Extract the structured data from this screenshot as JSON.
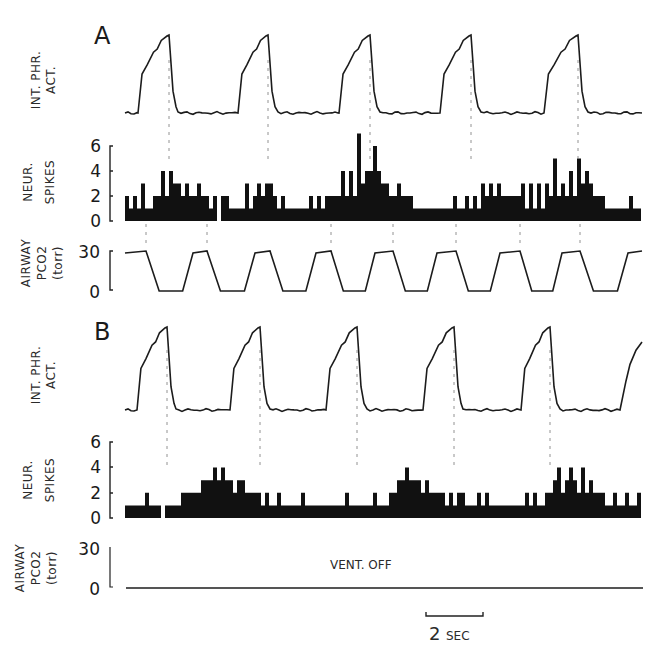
{
  "figure": {
    "panels": [
      {
        "id": "A",
        "label": "A",
        "phrenic": {
          "ylabel_line1": "INT. PHR.",
          "ylabel_line2": "ACT."
        },
        "spikes": {
          "ylabel_line1": "NEUR.",
          "ylabel_line2": "SPIKES",
          "ticks": [
            "6",
            "4",
            "2",
            "0"
          ]
        },
        "pco2": {
          "ylabel_line1": "AIRWAY",
          "ylabel_line2": "PCO2",
          "ylabel_line3": "(torr)",
          "ticks": [
            "30",
            "0"
          ],
          "annotation": ""
        }
      },
      {
        "id": "B",
        "label": "B",
        "phrenic": {
          "ylabel_line1": "INT. PHR.",
          "ylabel_line2": "ACT."
        },
        "spikes": {
          "ylabel_line1": "NEUR.",
          "ylabel_line2": "SPIKES",
          "ticks": [
            "6",
            "4",
            "2",
            "0"
          ]
        },
        "pco2": {
          "ylabel_line1": "AIRWAY",
          "ylabel_line2": "PCO2",
          "ylabel_line3": "(torr)",
          "ticks": [
            "30",
            "0"
          ],
          "annotation": "VENT. OFF"
        }
      }
    ],
    "scale_bar": {
      "value": "2",
      "unit": "SEC"
    }
  },
  "chart_data": [
    {
      "type": "line",
      "panel": "A",
      "title": "Integrated phrenic activity (ventilator on)",
      "ylabel": "INT. PHR. ACT.",
      "xlabel": "time",
      "cycles": 5,
      "cycle_period_sec": 3.5,
      "peak_times_px": [
        169,
        268,
        370,
        471,
        578
      ],
      "rise_start_px": [
        138,
        238,
        339,
        440,
        544
      ],
      "fall_end_px": [
        178,
        278,
        380,
        481,
        588
      ],
      "units": "arbitrary (normalized 0-1)",
      "peak_value": 1.0,
      "baseline_value": 0.0
    },
    {
      "type": "bar",
      "panel": "A",
      "title": "Neuron spike histogram (ventilator on)",
      "ylabel": "NEUR. SPIKES",
      "ylim": [
        0,
        6
      ],
      "yticks": [
        0,
        2,
        4,
        6
      ],
      "bin_width_px": 4,
      "x_start_px": 125,
      "values": [
        2,
        1,
        2,
        1,
        3,
        1,
        1,
        2,
        2,
        4,
        2,
        4,
        3,
        3,
        2,
        3,
        2,
        2,
        3,
        2,
        2,
        1,
        2,
        0,
        2,
        2,
        1,
        1,
        1,
        1,
        3,
        1,
        2,
        3,
        2,
        3,
        3,
        2,
        1,
        2,
        1,
        1,
        1,
        1,
        1,
        1,
        2,
        1,
        2,
        1,
        2,
        2,
        2,
        2,
        4,
        2,
        4,
        2,
        7,
        3,
        4,
        4,
        6,
        4,
        3,
        3,
        2,
        2,
        3,
        2,
        2,
        2,
        1,
        1,
        1,
        1,
        1,
        1,
        1,
        1,
        1,
        1,
        2,
        1,
        1,
        2,
        1,
        2,
        1,
        3,
        2,
        3,
        2,
        3,
        2,
        2,
        2,
        2,
        2,
        3,
        1,
        3,
        1,
        3,
        1,
        3,
        2,
        5,
        2,
        3,
        2,
        4,
        2,
        5,
        3,
        4,
        3,
        2,
        2,
        2,
        1,
        1,
        1,
        1,
        1,
        1,
        2,
        1,
        1,
        0,
        1,
        1,
        1,
        1,
        1,
        1,
        1,
        3,
        2,
        4,
        2,
        6,
        3,
        5,
        2,
        3,
        2,
        3,
        2,
        2,
        1,
        2,
        2,
        2,
        1,
        1,
        2,
        1,
        1,
        2,
        1,
        3,
        2,
        2,
        2,
        1,
        2,
        3,
        1,
        2,
        2,
        2,
        1,
        2,
        1,
        2,
        2,
        2,
        3,
        2,
        5,
        2,
        3,
        4,
        5,
        4,
        3,
        2,
        4,
        2,
        2,
        2,
        1,
        1,
        1,
        2,
        3,
        1,
        2,
        2,
        4,
        2,
        3,
        2,
        6,
        1,
        3,
        3,
        3,
        2,
        2,
        2,
        5,
        2,
        3,
        2,
        2,
        2,
        1,
        1,
        1,
        2,
        1,
        2,
        3,
        1,
        1,
        2,
        1,
        2
      ]
    },
    {
      "type": "line",
      "panel": "A",
      "title": "Airway PCO2 (ventilator on)",
      "ylabel": "AIRWAY PCO2 (torr)",
      "ylim": [
        0,
        30
      ],
      "yticks": [
        0,
        30
      ],
      "shape": "trapezoidal square wave",
      "high_value": 30,
      "low_value": 0,
      "cycles": 8,
      "high_plateaus_px": [
        [
          125,
          146
        ],
        [
          193,
          207
        ],
        [
          255,
          270
        ],
        [
          316,
          331
        ],
        [
          375,
          393
        ],
        [
          437,
          456
        ],
        [
          500,
          520
        ],
        [
          562,
          580
        ],
        [
          628,
          642
        ]
      ]
    },
    {
      "type": "line",
      "panel": "B",
      "title": "Integrated phrenic activity (ventilator off)",
      "ylabel": "INT. PHR. ACT.",
      "xlabel": "time",
      "cycles": 5,
      "peak_times_px": [
        167,
        260,
        357,
        454,
        550
      ],
      "rise_start_px": [
        137,
        230,
        326,
        423,
        521
      ],
      "fall_end_px": [
        176,
        270,
        367,
        463,
        560
      ],
      "partial_rise_start_px": 620,
      "units": "arbitrary (normalized 0-1)"
    },
    {
      "type": "bar",
      "panel": "B",
      "title": "Neuron spike histogram (ventilator off)",
      "ylabel": "NEUR. SPIKES",
      "ylim": [
        0,
        6
      ],
      "yticks": [
        0,
        2,
        4,
        6
      ],
      "bin_width_px": 4,
      "x_start_px": 125,
      "values": [
        1,
        1,
        1,
        1,
        1,
        2,
        1,
        1,
        1,
        0,
        1,
        1,
        1,
        1,
        2,
        2,
        2,
        2,
        2,
        3,
        3,
        3,
        4,
        3,
        4,
        3,
        3,
        2,
        3,
        3,
        2,
        2,
        2,
        2,
        1,
        2,
        1,
        1,
        2,
        1,
        1,
        1,
        1,
        1,
        2,
        1,
        1,
        1,
        1,
        1,
        1,
        1,
        1,
        1,
        1,
        2,
        1,
        1,
        1,
        1,
        1,
        1,
        2,
        1,
        1,
        1,
        2,
        2,
        3,
        3,
        4,
        3,
        3,
        3,
        2,
        3,
        2,
        2,
        2,
        2,
        1,
        2,
        1,
        2,
        2,
        1,
        1,
        1,
        2,
        1,
        2,
        1,
        1,
        1,
        1,
        1,
        1,
        1,
        1,
        1,
        2,
        1,
        2,
        1,
        1,
        2,
        2,
        3,
        4,
        2,
        3,
        4,
        3,
        2,
        4,
        2,
        3,
        2,
        2,
        2,
        1,
        1,
        2,
        1,
        1,
        2,
        1,
        1,
        2,
        1,
        1,
        1,
        1,
        1,
        1,
        1,
        2,
        1,
        2,
        1,
        1,
        1,
        0,
        1,
        2,
        1,
        2,
        2,
        3,
        3,
        3,
        4,
        3,
        4,
        3,
        5,
        3,
        4,
        3,
        2,
        4,
        2,
        2,
        2,
        1,
        1,
        1,
        2,
        1,
        2,
        1,
        1,
        2,
        1,
        1,
        1,
        1,
        1,
        1,
        1,
        2,
        1,
        2,
        1,
        1,
        2,
        2,
        3,
        3,
        3,
        3,
        3,
        4,
        3,
        5,
        3,
        4,
        5,
        2,
        1,
        2,
        1,
        2,
        2,
        1,
        1,
        2,
        1,
        2,
        1,
        1,
        2,
        1,
        1,
        2,
        1,
        1,
        2,
        1,
        1,
        0,
        1,
        2,
        1,
        1,
        2
      ]
    },
    {
      "type": "line",
      "panel": "B",
      "title": "Airway PCO2 (ventilator off)",
      "ylabel": "AIRWAY PCO2 (torr)",
      "ylim": [
        0,
        30
      ],
      "yticks": [
        0,
        30
      ],
      "values": "constant 0",
      "annotation": "VENT. OFF"
    }
  ]
}
